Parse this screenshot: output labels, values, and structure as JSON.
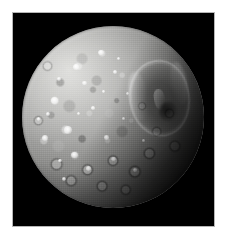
{
  "page": {
    "background_color": "#ffffff",
    "width": 229,
    "height": 241
  },
  "photo": {
    "subject": "Mimas",
    "subject_description": "Saturn's moon Mimas, heavily cratered icy body with the large Herschel impact crater on the right limb",
    "image_type": "grayscale astronomical photograph",
    "background_color": "#000000",
    "frame_color": "#b6b6b6",
    "caption": ""
  },
  "moon": {
    "name": "Mimas",
    "disk_shape": "circle",
    "surface_tone": "gray cratered ice",
    "illumination": "sunlit from upper-left, terminator toward lower-right",
    "bright_color": "#d3d3d0",
    "mid_color": "#8a8a88",
    "shadow_color": "#0c0c0c"
  },
  "features": {
    "herschel_crater": {
      "name": "Herschel Crater",
      "position": "right of center, upper hemisphere",
      "description": "large impact basin with bright raised rim and central peak"
    },
    "bright_highland": {
      "name": "Bright Highland Terrain",
      "position": "upper-left hemisphere"
    },
    "cratered_lowlands": {
      "name": "Densely Cratered Terrain",
      "position": "lower hemisphere toward terminator"
    },
    "terminator": {
      "name": "Terminator",
      "position": "lower-right limb"
    }
  },
  "speckles": [
    {
      "left": "16%",
      "top": "39%",
      "size": "4.0%"
    },
    {
      "left": "28%",
      "top": "21%",
      "size": "3.4%"
    },
    {
      "left": "42%",
      "top": "13%",
      "size": "3.0%"
    },
    {
      "left": "23%",
      "top": "55%",
      "size": "4.4%"
    },
    {
      "left": "11%",
      "top": "60%",
      "size": "3.2%"
    },
    {
      "left": "33%",
      "top": "30%",
      "size": "2.6%"
    },
    {
      "left": "50%",
      "top": "24%",
      "size": "2.4%"
    },
    {
      "left": "27%",
      "top": "69%",
      "size": "3.6%"
    },
    {
      "left": "45%",
      "top": "60%",
      "size": "2.6%"
    },
    {
      "left": "19%",
      "top": "28%",
      "size": "2.2%"
    },
    {
      "left": "38%",
      "top": "44%",
      "size": "2.0%"
    },
    {
      "left": "57%",
      "top": "36%",
      "size": "2.0%"
    },
    {
      "left": "13%",
      "top": "47%",
      "size": "2.4%"
    },
    {
      "left": "35%",
      "top": "77%",
      "size": "2.8%"
    },
    {
      "left": "49%",
      "top": "72%",
      "size": "2.4%"
    },
    {
      "left": "61%",
      "top": "78%",
      "size": "2.0%"
    },
    {
      "left": "22%",
      "top": "83%",
      "size": "2.2%"
    },
    {
      "left": "55%",
      "top": "50%",
      "size": "1.8%"
    },
    {
      "left": "66%",
      "top": "62%",
      "size": "1.8%"
    },
    {
      "left": "30%",
      "top": "47%",
      "size": "1.8%"
    },
    {
      "left": "44%",
      "top": "35%",
      "size": "1.6%"
    },
    {
      "left": "20%",
      "top": "73%",
      "size": "2.0%"
    },
    {
      "left": "8%",
      "top": "50%",
      "size": "2.0%"
    },
    {
      "left": "52%",
      "top": "17%",
      "size": "1.8%"
    }
  ]
}
